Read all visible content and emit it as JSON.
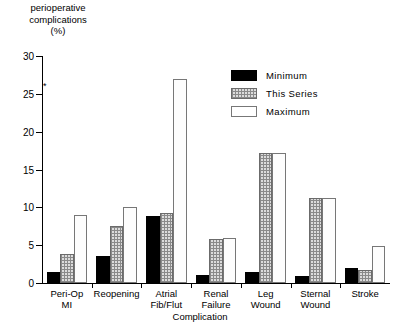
{
  "chart_data": {
    "type": "bar",
    "title": "",
    "ylabel_lines": [
      "perioperative",
      "complications",
      "(%)"
    ],
    "ylabel": "perioperative complications (%)",
    "xlabel": "Complication",
    "ylim": [
      0,
      30
    ],
    "yticks": [
      0,
      5,
      10,
      15,
      20,
      25,
      30
    ],
    "grid": false,
    "legend_position": "top-right",
    "annotations": [
      {
        "text": "*",
        "near_y": 26
      }
    ],
    "categories": [
      "Peri-Op MI",
      "Reopening",
      "Atrial Fib/Flut",
      "Renal Failure",
      "Leg Wound",
      "Sternal Wound",
      "Stroke"
    ],
    "category_lines": [
      [
        "Peri-Op",
        "MI"
      ],
      [
        "Reopening"
      ],
      [
        "Atrial",
        "Fib/Flut"
      ],
      [
        "Renal",
        "Failure"
      ],
      [
        "Leg",
        "Wound"
      ],
      [
        "Sternal",
        "Wound"
      ],
      [
        "Stroke"
      ]
    ],
    "series": [
      {
        "name": "Minimum",
        "color": "#000000",
        "values": [
          1.5,
          3.6,
          8.8,
          1.1,
          1.4,
          0.9,
          2.0
        ]
      },
      {
        "name": "This Series",
        "color": "#c8c8c8",
        "values": [
          3.8,
          7.5,
          9.3,
          5.8,
          17.2,
          11.2,
          1.7
        ]
      },
      {
        "name": "Maximum",
        "color": "#ffffff",
        "values": [
          9.0,
          10.0,
          27.0,
          6.0,
          17.2,
          11.2,
          4.9
        ]
      }
    ]
  },
  "legend": {
    "items": [
      {
        "label": "Minimum"
      },
      {
        "label": "This Series"
      },
      {
        "label": "Maximum"
      }
    ]
  }
}
